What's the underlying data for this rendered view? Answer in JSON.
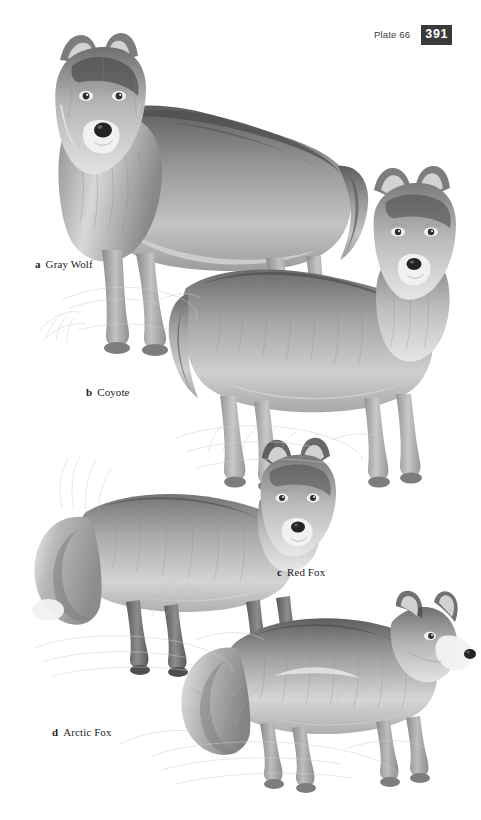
{
  "header": {
    "plate_caption": "Plate 66",
    "page_number": "391",
    "badge_color": "#3a3a3a"
  },
  "figures": [
    {
      "key": "a",
      "label": "Gray Wolf",
      "name_id": "gray-wolf"
    },
    {
      "key": "b",
      "label": "Coyote",
      "name_id": "coyote"
    },
    {
      "key": "c",
      "label": "Red Fox",
      "name_id": "red-fox"
    },
    {
      "key": "d",
      "label": "Arctic Fox",
      "name_id": "arctic-fox"
    }
  ],
  "plate": {
    "medium": "grayscale pencil illustration",
    "background_color": "#ffffff",
    "ink_colors": [
      "#4e4e4e",
      "#7d7d7d",
      "#ababab",
      "#d2d2d2",
      "#f2f2f2"
    ]
  }
}
